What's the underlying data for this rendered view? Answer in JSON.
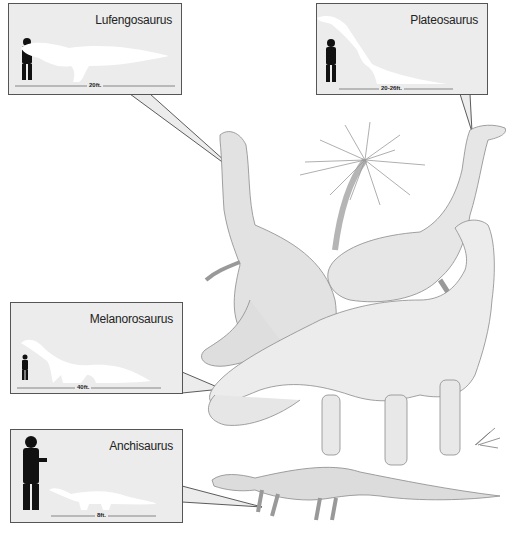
{
  "figure": {
    "colors": {
      "callout_bg": "#ececec",
      "callout_border": "#555555",
      "silhouette_human": "#111111",
      "silhouette_dino": "#ffffff",
      "illustration_line": "#8a8a8a",
      "illustration_fill": "#e4e4e4"
    }
  },
  "callouts": [
    {
      "name": "Lufengosaurus",
      "length": "20ft."
    },
    {
      "name": "Plateosaurus",
      "length": "20-26ft."
    },
    {
      "name": "Melanorosaurus",
      "length": "40ft."
    },
    {
      "name": "Anchisaurus",
      "length": "8ft."
    }
  ],
  "illustration": {
    "elements": [
      "Lufengosaurus",
      "Plateosaurus",
      "Melanorosaurus",
      "Anchisaurus",
      "cycad-tree",
      "fern-plant"
    ]
  }
}
